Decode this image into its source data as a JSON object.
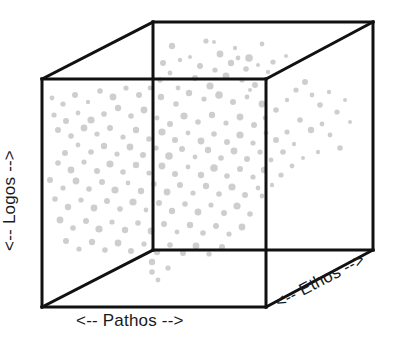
{
  "figure": {
    "type": "3d-scatter-cube",
    "title": "",
    "background_color": "#ffffff",
    "edge_color": "#111111",
    "edge_width": 3,
    "dot_color": "#c6c6c6",
    "dot_opacity": 0.85
  },
  "labels": {
    "x_axis": "<-- Pathos -->",
    "y_axis": "<-- Logos -->",
    "z_axis": "<-- Ethos -->"
  },
  "cube": {
    "front_top_left": [
      42,
      79
    ],
    "front_top_right": [
      266,
      79
    ],
    "front_bottom_left": [
      42,
      307
    ],
    "front_bottom_right": [
      266,
      307
    ],
    "back_top_left": [
      153,
      22
    ],
    "back_top_right": [
      373,
      22
    ],
    "back_bottom_left": [
      153,
      250
    ],
    "back_bottom_right": [
      373,
      250
    ]
  },
  "chart_data": {
    "type": "scatter",
    "title": "",
    "xlabel": "<-- Pathos -->",
    "ylabel": "<-- Logos -->",
    "zlabel": "<-- Ethos -->",
    "grid": false,
    "legend": "none",
    "point_color": "#c6c6c6",
    "n_points": 196,
    "points": [
      [
        172,
        46,
        3.2
      ],
      [
        190,
        57,
        2.0
      ],
      [
        206,
        41,
        2.6
      ],
      [
        220,
        54,
        3.4
      ],
      [
        235,
        48,
        2.2
      ],
      [
        249,
        58,
        3.8
      ],
      [
        262,
        44,
        2.4
      ],
      [
        200,
        66,
        3.0
      ],
      [
        215,
        70,
        2.6
      ],
      [
        231,
        63,
        3.2
      ],
      [
        246,
        69,
        2.8
      ],
      [
        180,
        60,
        2.2
      ],
      [
        163,
        63,
        3.0
      ],
      [
        258,
        65,
        2.0
      ],
      [
        226,
        76,
        3.4
      ],
      [
        242,
        80,
        2.6
      ],
      [
        195,
        78,
        3.0
      ],
      [
        210,
        86,
        3.6
      ],
      [
        178,
        88,
        2.4
      ],
      [
        160,
        80,
        2.8
      ],
      [
        255,
        85,
        3.0
      ],
      [
        268,
        72,
        2.2
      ],
      [
        273,
        62,
        2.6
      ],
      [
        286,
        56,
        2.0
      ],
      [
        170,
        73,
        2.4
      ],
      [
        189,
        93,
        3.2
      ],
      [
        204,
        99,
        2.6
      ],
      [
        219,
        95,
        3.8
      ],
      [
        233,
        102,
        3.0
      ],
      [
        247,
        97,
        2.4
      ],
      [
        262,
        104,
        3.4
      ],
      [
        176,
        104,
        2.8
      ],
      [
        161,
        97,
        3.2
      ],
      [
        150,
        88,
        2.4
      ],
      [
        139,
        95,
        3.0
      ],
      [
        126,
        88,
        2.6
      ],
      [
        113,
        97,
        3.4
      ],
      [
        100,
        91,
        2.8
      ],
      [
        88,
        102,
        2.2
      ],
      [
        75,
        95,
        3.0
      ],
      [
        63,
        104,
        2.6
      ],
      [
        52,
        98,
        2.4
      ],
      [
        118,
        108,
        3.2
      ],
      [
        104,
        114,
        2.8
      ],
      [
        91,
        120,
        3.6
      ],
      [
        78,
        113,
        2.4
      ],
      [
        66,
        121,
        3.0
      ],
      [
        54,
        115,
        2.6
      ],
      [
        131,
        116,
        2.8
      ],
      [
        144,
        110,
        3.4
      ],
      [
        157,
        118,
        2.4
      ],
      [
        170,
        124,
        3.0
      ],
      [
        184,
        116,
        3.6
      ],
      [
        198,
        122,
        2.8
      ],
      [
        212,
        115,
        3.2
      ],
      [
        226,
        123,
        2.6
      ],
      [
        240,
        117,
        3.4
      ],
      [
        254,
        125,
        3.0
      ],
      [
        265,
        118,
        2.4
      ],
      [
        276,
        110,
        2.8
      ],
      [
        287,
        100,
        2.2
      ],
      [
        296,
        90,
        2.6
      ],
      [
        305,
        82,
        3.0
      ],
      [
        312,
        95,
        2.4
      ],
      [
        320,
        105,
        2.8
      ],
      [
        329,
        92,
        2.2
      ],
      [
        337,
        112,
        2.6
      ],
      [
        345,
        100,
        2.0
      ],
      [
        300,
        120,
        2.8
      ],
      [
        311,
        130,
        3.2
      ],
      [
        322,
        124,
        2.4
      ],
      [
        287,
        132,
        2.6
      ],
      [
        276,
        140,
        3.0
      ],
      [
        266,
        133,
        2.4
      ],
      [
        110,
        128,
        3.0
      ],
      [
        97,
        134,
        2.6
      ],
      [
        84,
        128,
        3.4
      ],
      [
        71,
        136,
        2.8
      ],
      [
        58,
        130,
        3.0
      ],
      [
        123,
        137,
        2.6
      ],
      [
        136,
        130,
        3.2
      ],
      [
        149,
        139,
        2.8
      ],
      [
        162,
        132,
        3.6
      ],
      [
        175,
        140,
        3.0
      ],
      [
        188,
        133,
        2.4
      ],
      [
        201,
        141,
        3.4
      ],
      [
        214,
        134,
        2.8
      ],
      [
        227,
        142,
        3.0
      ],
      [
        240,
        135,
        3.6
      ],
      [
        253,
        143,
        2.6
      ],
      [
        104,
        146,
        3.2
      ],
      [
        91,
        152,
        2.8
      ],
      [
        78,
        145,
        2.4
      ],
      [
        65,
        153,
        3.0
      ],
      [
        117,
        154,
        2.6
      ],
      [
        130,
        147,
        3.4
      ],
      [
        143,
        155,
        3.0
      ],
      [
        156,
        148,
        2.6
      ],
      [
        169,
        156,
        3.8
      ],
      [
        182,
        149,
        3.0
      ],
      [
        195,
        157,
        2.4
      ],
      [
        208,
        150,
        3.2
      ],
      [
        221,
        158,
        2.8
      ],
      [
        234,
        151,
        3.4
      ],
      [
        247,
        159,
        3.0
      ],
      [
        260,
        152,
        2.6
      ],
      [
        271,
        160,
        2.4
      ],
      [
        283,
        152,
        2.8
      ],
      [
        294,
        144,
        2.2
      ],
      [
        58,
        163,
        2.8
      ],
      [
        71,
        170,
        3.4
      ],
      [
        84,
        162,
        2.6
      ],
      [
        97,
        171,
        3.0
      ],
      [
        110,
        164,
        3.6
      ],
      [
        123,
        172,
        2.8
      ],
      [
        136,
        165,
        3.2
      ],
      [
        149,
        173,
        2.6
      ],
      [
        162,
        166,
        3.4
      ],
      [
        175,
        174,
        3.0
      ],
      [
        188,
        167,
        2.4
      ],
      [
        201,
        175,
        3.2
      ],
      [
        214,
        168,
        3.8
      ],
      [
        227,
        176,
        2.8
      ],
      [
        240,
        169,
        3.0
      ],
      [
        253,
        177,
        2.6
      ],
      [
        264,
        170,
        3.2
      ],
      [
        50,
        180,
        3.0
      ],
      [
        63,
        188,
        2.6
      ],
      [
        76,
        181,
        3.4
      ],
      [
        89,
        189,
        2.8
      ],
      [
        102,
        182,
        3.0
      ],
      [
        115,
        190,
        3.6
      ],
      [
        128,
        183,
        2.4
      ],
      [
        141,
        191,
        3.2
      ],
      [
        154,
        184,
        2.8
      ],
      [
        167,
        192,
        3.4
      ],
      [
        180,
        185,
        3.0
      ],
      [
        193,
        193,
        2.6
      ],
      [
        206,
        186,
        3.2
      ],
      [
        219,
        194,
        2.8
      ],
      [
        232,
        187,
        3.6
      ],
      [
        245,
        195,
        3.0
      ],
      [
        258,
        188,
        2.4
      ],
      [
        55,
        199,
        2.8
      ],
      [
        68,
        207,
        3.2
      ],
      [
        81,
        200,
        2.6
      ],
      [
        94,
        208,
        3.4
      ],
      [
        107,
        201,
        3.0
      ],
      [
        120,
        209,
        2.8
      ],
      [
        133,
        202,
        3.6
      ],
      [
        146,
        210,
        2.4
      ],
      [
        159,
        203,
        3.0
      ],
      [
        172,
        211,
        3.2
      ],
      [
        185,
        204,
        2.8
      ],
      [
        198,
        212,
        3.4
      ],
      [
        211,
        205,
        2.6
      ],
      [
        224,
        213,
        3.0
      ],
      [
        237,
        206,
        3.6
      ],
      [
        250,
        214,
        2.8
      ],
      [
        60,
        220,
        3.4
      ],
      [
        73,
        228,
        2.8
      ],
      [
        86,
        221,
        3.0
      ],
      [
        99,
        229,
        3.6
      ],
      [
        112,
        222,
        2.6
      ],
      [
        125,
        230,
        3.2
      ],
      [
        138,
        223,
        2.8
      ],
      [
        151,
        231,
        3.4
      ],
      [
        164,
        224,
        3.0
      ],
      [
        177,
        232,
        2.4
      ],
      [
        190,
        225,
        3.2
      ],
      [
        203,
        233,
        2.8
      ],
      [
        216,
        226,
        3.0
      ],
      [
        229,
        234,
        2.6
      ],
      [
        242,
        227,
        3.4
      ],
      [
        66,
        241,
        3.0
      ],
      [
        79,
        249,
        2.6
      ],
      [
        92,
        242,
        3.2
      ],
      [
        105,
        250,
        2.8
      ],
      [
        118,
        243,
        3.4
      ],
      [
        131,
        251,
        3.0
      ],
      [
        144,
        244,
        2.6
      ],
      [
        157,
        252,
        3.2
      ],
      [
        170,
        245,
        2.8
      ],
      [
        183,
        253,
        3.0
      ],
      [
        196,
        246,
        3.4
      ],
      [
        209,
        254,
        2.6
      ],
      [
        222,
        247,
        3.0
      ],
      [
        152,
        262,
        3.2
      ],
      [
        152,
        272,
        2.8
      ],
      [
        158,
        280,
        2.4
      ],
      [
        168,
        268,
        2.6
      ],
      [
        330,
        135,
        2.4
      ],
      [
        340,
        148,
        2.8
      ],
      [
        318,
        152,
        2.2
      ],
      [
        350,
        122,
        2.0
      ],
      [
        292,
        166,
        2.4
      ],
      [
        303,
        158,
        2.0
      ],
      [
        281,
        175,
        2.6
      ],
      [
        272,
        185,
        2.2
      ],
      [
        262,
        196,
        2.4
      ],
      [
        250,
        90,
        2.0
      ],
      [
        238,
        58,
        2.4
      ],
      [
        214,
        42,
        2.0
      ]
    ]
  }
}
